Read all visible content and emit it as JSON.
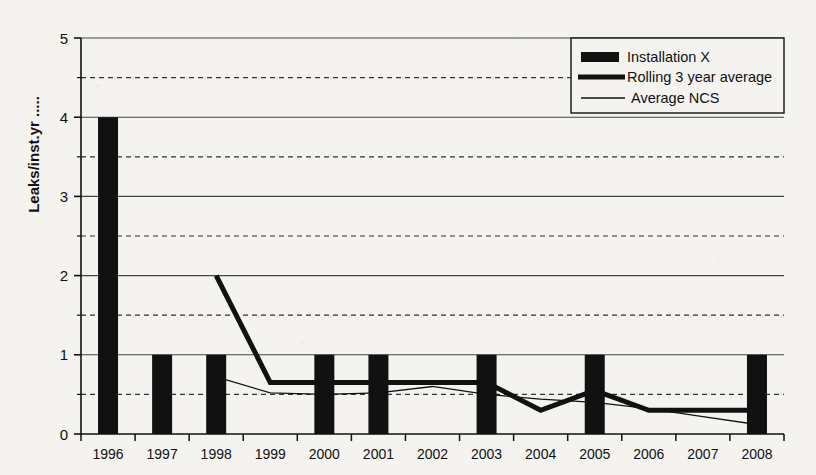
{
  "chart_data": {
    "type": "bar",
    "title": "",
    "xlabel": "",
    "ylabel": "Leaks/inst.yr .....",
    "categories": [
      "1996",
      "1997",
      "1998",
      "1999",
      "2000",
      "2001",
      "2002",
      "2003",
      "2004",
      "2005",
      "2006",
      "2007",
      "2008"
    ],
    "ylim": [
      0,
      5
    ],
    "xlim_labels": [
      "1996",
      "2008"
    ],
    "grid": "major solid at integers, minor dashed at 0.5 steps",
    "legend_position": "top-right inside plot",
    "yticks": [
      "0",
      "1",
      "2",
      "3",
      "4",
      "5"
    ],
    "yticks_values": [
      0,
      1,
      2,
      3,
      4,
      5
    ],
    "minor_gridlines": [
      0.5,
      1.5,
      2.5,
      3.5,
      4.5
    ],
    "series": [
      {
        "name": "Installation X",
        "render": "bar",
        "style": "solid black bars",
        "values": [
          4,
          1,
          1,
          0,
          1,
          1,
          0,
          1,
          0,
          1,
          0,
          0,
          1
        ]
      },
      {
        "name": "Rolling 3 year average",
        "render": "line",
        "style": "thick black line",
        "x": [
          "1998",
          "1999",
          "2000",
          "2001",
          "2002",
          "2003",
          "2004",
          "2005",
          "2006",
          "2007",
          "2008"
        ],
        "values": [
          2.0,
          0.65,
          0.65,
          0.65,
          0.65,
          0.65,
          0.3,
          0.55,
          0.3,
          0.3,
          0.3
        ]
      },
      {
        "name": "Average NCS",
        "render": "line",
        "style": "thin black line",
        "x": [
          "1998",
          "1999",
          "2000",
          "2001",
          "2002",
          "2003",
          "2004",
          "2005",
          "2006",
          "2007",
          "2008"
        ],
        "values": [
          0.72,
          0.52,
          0.5,
          0.52,
          0.6,
          0.5,
          0.44,
          0.4,
          0.32,
          0.22,
          0.12
        ]
      }
    ]
  },
  "legend": {
    "items": [
      {
        "label": "Installation X",
        "marker": "filled-rect-swatch"
      },
      {
        "label": "Rolling 3 year average",
        "marker": "thick-line-swatch"
      },
      {
        "label": "Average NCS",
        "marker": "thin-line-swatch"
      }
    ]
  },
  "colors": {
    "ink": "#111111",
    "paper": "#f4f3f0",
    "bar": "#111111",
    "grid_major": "#444444",
    "grid_minor": "#333333"
  }
}
